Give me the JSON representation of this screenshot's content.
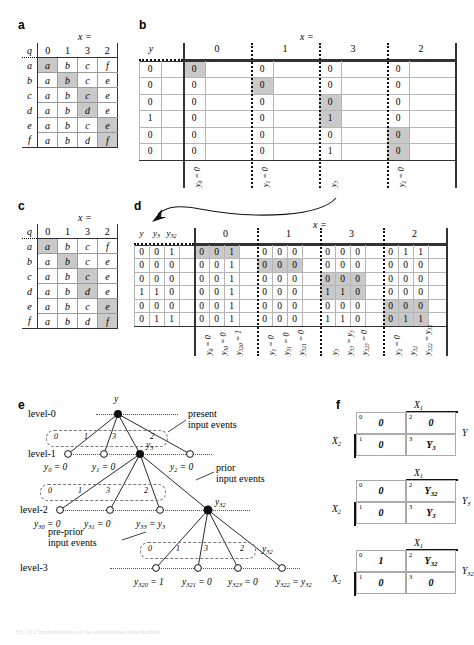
{
  "figure": {
    "caption": "Fig. 13.2 Implementation of the asynchronous state machine"
  },
  "panels": {
    "a": {
      "letter": "a",
      "x_label": "x =",
      "row_header": "q",
      "columns": [
        "0",
        "1",
        "3",
        "2"
      ],
      "rows": [
        {
          "q": "a",
          "cells": [
            "a",
            "b",
            "c",
            "f"
          ],
          "stable": 0
        },
        {
          "q": "b",
          "cells": [
            "a",
            "b",
            "c",
            "e"
          ],
          "stable": 1
        },
        {
          "q": "c",
          "cells": [
            "a",
            "b",
            "c",
            "e"
          ],
          "stable": 2
        },
        {
          "q": "d",
          "cells": [
            "a",
            "b",
            "d",
            "e"
          ],
          "stable": 2
        },
        {
          "q": "e",
          "cells": [
            "a",
            "b",
            "c",
            "e"
          ],
          "stable": 3
        },
        {
          "q": "f",
          "cells": [
            "a",
            "b",
            "d",
            "f"
          ],
          "stable": 3
        }
      ]
    },
    "b": {
      "letter": "b",
      "x_label": "x =",
      "row_header": "y",
      "groups": [
        "0",
        "1",
        "3",
        "2"
      ],
      "y_values": [
        "0",
        "0",
        "0",
        "1",
        "0",
        "0"
      ],
      "cells": [
        [
          "0",
          "0",
          "0",
          "0"
        ],
        [
          "0",
          "0",
          "0",
          "0"
        ],
        [
          "0",
          "0",
          "0",
          "0"
        ],
        [
          "0",
          "0",
          "1",
          "0"
        ],
        [
          "0",
          "0",
          "0",
          "0"
        ],
        [
          "0",
          "0",
          "1",
          "0"
        ]
      ],
      "shaded": [
        [
          0,
          0
        ],
        [
          1,
          1
        ],
        [
          2,
          2
        ],
        [
          3,
          2
        ],
        [
          4,
          3
        ],
        [
          5,
          3
        ]
      ],
      "bottom_labels": [
        "y0 = 0",
        "y1 = 0",
        "y3",
        "y2 = 0"
      ]
    },
    "c": {
      "letter": "c",
      "x_label": "x =",
      "row_header": "q",
      "columns": [
        "0",
        "1",
        "3",
        "2"
      ],
      "rows": [
        {
          "q": "a",
          "cells": [
            "a",
            "b",
            "c",
            "f"
          ],
          "stable": 0
        },
        {
          "q": "b",
          "cells": [
            "a",
            "b",
            "c",
            "e"
          ],
          "stable": 1
        },
        {
          "q": "c",
          "cells": [
            "a",
            "b",
            "c",
            "e"
          ],
          "stable": 2
        },
        {
          "q": "d",
          "cells": [
            "a",
            "b",
            "d",
            "e"
          ],
          "stable": 2
        },
        {
          "q": "e",
          "cells": [
            "a",
            "b",
            "c",
            "e"
          ],
          "stable": 3
        },
        {
          "q": "f",
          "cells": [
            "a",
            "b",
            "d",
            "f"
          ],
          "stable": 3
        }
      ]
    },
    "d": {
      "letter": "d",
      "x_label": "x =",
      "state_headers": [
        "y",
        "y3",
        "y32"
      ],
      "groups": [
        "0",
        "1",
        "3",
        "2"
      ],
      "state_rows": [
        [
          "0",
          "0",
          "1"
        ],
        [
          "0",
          "0",
          "0"
        ],
        [
          "0",
          "0",
          "0"
        ],
        [
          "1",
          "1",
          "0"
        ],
        [
          "0",
          "0",
          "0"
        ],
        [
          "0",
          "1",
          "1"
        ]
      ],
      "cells": [
        [
          [
            "0",
            "0",
            "1"
          ],
          [
            "0",
            "0",
            "0"
          ],
          [
            "0",
            "0",
            "0"
          ],
          [
            "0",
            "1",
            "1"
          ]
        ],
        [
          [
            "0",
            "0",
            "1"
          ],
          [
            "0",
            "0",
            "0"
          ],
          [
            "0",
            "0",
            "0"
          ],
          [
            "0",
            "0",
            "0"
          ]
        ],
        [
          [
            "0",
            "0",
            "1"
          ],
          [
            "0",
            "0",
            "0"
          ],
          [
            "0",
            "0",
            "0"
          ],
          [
            "0",
            "0",
            "0"
          ]
        ],
        [
          [
            "0",
            "0",
            "1"
          ],
          [
            "0",
            "0",
            "0"
          ],
          [
            "1",
            "1",
            "0"
          ],
          [
            "0",
            "0",
            "0"
          ]
        ],
        [
          [
            "0",
            "0",
            "1"
          ],
          [
            "0",
            "0",
            "0"
          ],
          [
            "0",
            "0",
            "0"
          ],
          [
            "0",
            "0",
            "0"
          ]
        ],
        [
          [
            "0",
            "0",
            "1"
          ],
          [
            "0",
            "0",
            "0"
          ],
          [
            "1",
            "1",
            "0"
          ],
          [
            "0",
            "1",
            "1"
          ]
        ]
      ],
      "shaded_groups": [
        [
          0,
          0
        ],
        [
          1,
          1
        ],
        [
          2,
          2
        ],
        [
          3,
          2
        ],
        [
          4,
          3
        ],
        [
          5,
          3
        ]
      ],
      "bottom_labels": [
        [
          "y0 = 0",
          "y30 = 0",
          "y320 = 1"
        ],
        [
          "y1 = 0",
          "y31 = 0",
          "y321 = 0"
        ],
        [
          "y3",
          "y33 = y3",
          "y323 = 0"
        ],
        [
          "y2 = 0",
          "y32",
          "y322 = y32"
        ]
      ]
    },
    "e": {
      "letter": "e",
      "levels": [
        "level-0",
        "level-1",
        "level-2",
        "level-3"
      ],
      "root_label": "y",
      "edge_labels": [
        "0",
        "1",
        "3",
        "2"
      ],
      "annotations": {
        "present": "present\ninput events",
        "prior": "prior\ninput events",
        "pre_prior": "pre-prior\ninput events"
      },
      "level1_labels": [
        "y0 = 0",
        "y1 = 0",
        "y2 = 0"
      ],
      "level1_node_label": "y3",
      "level2_labels": [
        "y30 = 0",
        "y31 = 0",
        "y33 = y3"
      ],
      "level2_node_label": "y32",
      "level2_right_label": "y32",
      "level3_labels": [
        "y320 = 1",
        "y321 = 0",
        "y323 = 0",
        "y322 = y32"
      ]
    },
    "f": {
      "letter": "f",
      "maps": [
        {
          "top_label": "X1",
          "left_label": "X2",
          "right_label": "Y",
          "cells": [
            {
              "idx": "0",
              "val": "0"
            },
            {
              "idx": "2",
              "val": "0"
            },
            {
              "idx": "1",
              "val": "0"
            },
            {
              "idx": "3",
              "val": "Y3"
            }
          ]
        },
        {
          "top_label": "X1",
          "left_label": "X2",
          "right_label": "Y3",
          "cells": [
            {
              "idx": "0",
              "val": "0"
            },
            {
              "idx": "2",
              "val": "Y32"
            },
            {
              "idx": "1",
              "val": "0"
            },
            {
              "idx": "3",
              "val": "Y3"
            }
          ]
        },
        {
          "top_label": "X1",
          "left_label": "X2",
          "right_label": "Y32",
          "cells": [
            {
              "idx": "0",
              "val": "1"
            },
            {
              "idx": "2",
              "val": "Y32"
            },
            {
              "idx": "1",
              "val": "0"
            },
            {
              "idx": "3",
              "val": "0"
            }
          ]
        }
      ]
    }
  }
}
